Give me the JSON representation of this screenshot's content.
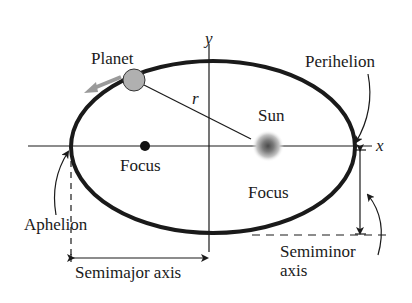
{
  "diagram": {
    "labels": {
      "planet": "Planet",
      "sun": "Sun",
      "focus_left": "Focus",
      "focus_right": "Focus",
      "perihelion": "Perihelion",
      "aphelion": "Aphelion",
      "semimajor_axis": "Semimajor axis",
      "semiminor_axis_line1": "Semiminor",
      "semiminor_axis_line2": "axis",
      "radius": "r",
      "x_axis": "x",
      "y_axis": "y"
    },
    "colors": {
      "orbit": "#1a1a1a",
      "planet_fill": "#b0b0b0",
      "motion_arrow": "#9a9a9a",
      "sun_core": "#555555"
    }
  }
}
